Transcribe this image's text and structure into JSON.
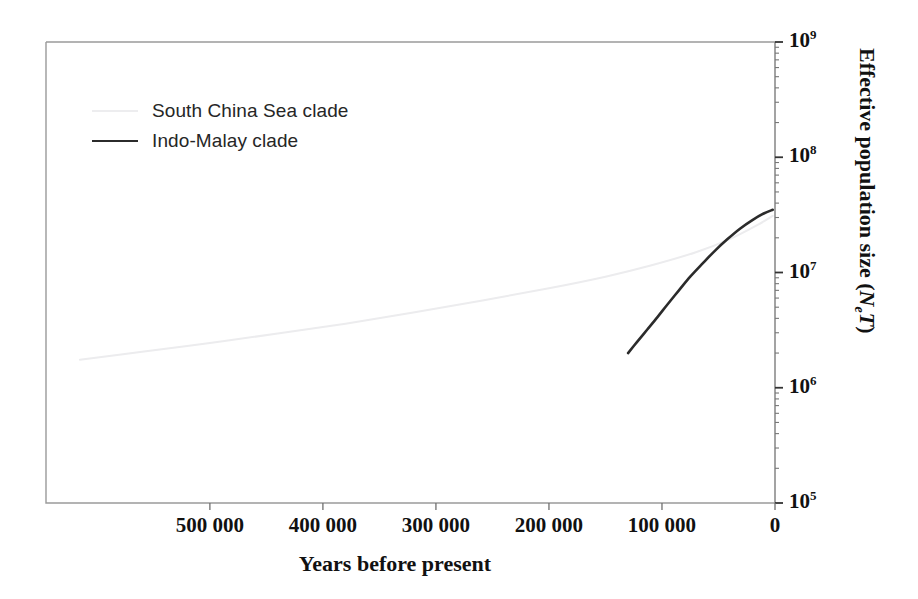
{
  "chart_data": {
    "type": "line",
    "title": "",
    "xlabel": "Years before present",
    "ylabel": "Effective population size (NeT)",
    "ylabel_main": "Effective population size (",
    "ylabel_n": "N",
    "ylabel_e": "e",
    "ylabel_t": "T",
    "ylabel_close": ")",
    "xlim": [
      645000,
      0
    ],
    "ylim": [
      100000,
      1000000000
    ],
    "yscale": "log",
    "xscale": "linear",
    "grid": false,
    "legend_position": "upper-left",
    "x_tick_labels": [
      "500 000",
      "400 000",
      "300 000",
      "200 000",
      "100 000",
      "0"
    ],
    "x_tick_values": [
      500000,
      400000,
      300000,
      200000,
      100000,
      0
    ],
    "y_tick_labels": [
      "10^9",
      "10^8",
      "10^7",
      "10^6",
      "10^5"
    ],
    "y_tick_bases": [
      "10",
      "10",
      "10",
      "10",
      "10"
    ],
    "y_tick_exponents": [
      "9",
      "8",
      "7",
      "6",
      "5"
    ],
    "y_tick_values": [
      1000000000,
      100000000,
      10000000,
      1000000,
      100000
    ],
    "series": [
      {
        "name": "South China Sea clade",
        "color": "#ececee",
        "linewidth": 2,
        "x": [
          615000,
          560000,
          500000,
          440000,
          380000,
          320000,
          260000,
          200000,
          150000,
          110000,
          70000,
          40000,
          15000,
          2000
        ],
        "y": [
          1750000,
          2050000,
          2450000,
          2950000,
          3600000,
          4500000,
          5700000,
          7300000,
          9200000,
          11500000,
          15000000,
          19500000,
          26000000,
          31000000
        ]
      },
      {
        "name": "Indo-Malay clade",
        "color": "#2b2b2b",
        "linewidth": 2.6,
        "x": [
          130000,
          122000,
          113000,
          104000,
          95000,
          85000,
          75000,
          64000,
          53000,
          42000,
          31000,
          20000,
          10000,
          2000
        ],
        "y": [
          2000000,
          2500000,
          3200000,
          4100000,
          5300000,
          7000000,
          9200000,
          12000000,
          15500000,
          19500000,
          24000000,
          28500000,
          32500000,
          35000000
        ]
      }
    ]
  },
  "legend": {
    "items": [
      {
        "label": "South China Sea clade",
        "style": "faint"
      },
      {
        "label": "Indo-Malay clade",
        "style": "dark"
      }
    ]
  },
  "axes": {
    "x_title": "Years before present",
    "y_title_prefix": "Effective population size (",
    "y_title_n": "N",
    "y_title_sub": "e",
    "y_title_t": "T",
    "y_title_suffix": ")"
  },
  "ticks": {
    "x": [
      {
        "label": "500 000",
        "value": 500000
      },
      {
        "label": "400 000",
        "value": 400000
      },
      {
        "label": "300 000",
        "value": 300000
      },
      {
        "label": "200 000",
        "value": 200000
      },
      {
        "label": "100 000",
        "value": 100000
      },
      {
        "label": "0",
        "value": 0
      }
    ],
    "y": [
      {
        "base": "10",
        "exp": "9",
        "value": 1000000000
      },
      {
        "base": "10",
        "exp": "8",
        "value": 100000000
      },
      {
        "base": "10",
        "exp": "7",
        "value": 10000000
      },
      {
        "base": "10",
        "exp": "6",
        "value": 1000000
      },
      {
        "base": "10",
        "exp": "5",
        "value": 100000
      }
    ]
  },
  "colors": {
    "frame": "#9a9a9a",
    "dark_series": "#2b2b2b",
    "faint_series": "#ececee",
    "text": "#111111",
    "background": "#ffffff"
  }
}
